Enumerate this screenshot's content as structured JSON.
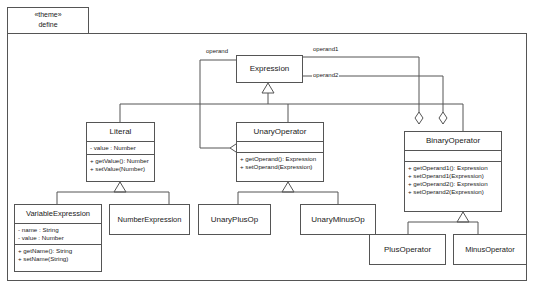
{
  "diagram": {
    "package": {
      "stereotype": "«theme»",
      "name": "define"
    },
    "colors": {
      "line": "#555555",
      "text": "#1a1a1a",
      "background": "#ffffff"
    },
    "classes": [
      {
        "id": "expression",
        "name": "Expression",
        "attributes": [],
        "operations": []
      },
      {
        "id": "literal",
        "name": "Literal",
        "attributes": [
          "- value : Number"
        ],
        "operations": [
          "+ getValue(): Number",
          "+ setValue(Number)"
        ]
      },
      {
        "id": "unaryoperator",
        "name": "UnaryOperator",
        "attributes": [],
        "operations": [
          "+ getOperand(): Expression",
          "+ setOperand(Expression)"
        ]
      },
      {
        "id": "binaryoperator",
        "name": "BinaryOperator",
        "attributes": [],
        "operations": [
          "+ getOperand1(): Expression",
          "+ setOperand1(Expression)",
          "+ getOperand2(): Expression",
          "+ setOperand2(Expression)"
        ]
      },
      {
        "id": "variableexpression",
        "name": "VariableExpression",
        "attributes": [
          "- name : String",
          "- value : Number"
        ],
        "operations": [
          "+ getName(): String",
          "+ setName(String)"
        ]
      },
      {
        "id": "numberexpression",
        "name": "NumberExpression",
        "attributes": [],
        "operations": []
      },
      {
        "id": "unaryplusop",
        "name": "UnaryPlusOp",
        "attributes": [],
        "operations": []
      },
      {
        "id": "unaryminusop",
        "name": "UnaryMinusOp",
        "attributes": [],
        "operations": []
      },
      {
        "id": "plusoperator",
        "name": "PlusOperator",
        "attributes": [],
        "operations": []
      },
      {
        "id": "minusoperator",
        "name": "MinusOperator",
        "attributes": [],
        "operations": []
      }
    ],
    "association_labels": {
      "operand": "operand",
      "operand1": "operand1",
      "operand2": "operand2"
    },
    "relationships": [
      {
        "type": "generalization",
        "from": "Literal",
        "to": "Expression"
      },
      {
        "type": "generalization",
        "from": "UnaryOperator",
        "to": "Expression"
      },
      {
        "type": "generalization",
        "from": "BinaryOperator",
        "to": "Expression"
      },
      {
        "type": "generalization",
        "from": "VariableExpression",
        "to": "Literal"
      },
      {
        "type": "generalization",
        "from": "NumberExpression",
        "to": "Literal"
      },
      {
        "type": "generalization",
        "from": "UnaryPlusOp",
        "to": "UnaryOperator"
      },
      {
        "type": "generalization",
        "from": "UnaryMinusOp",
        "to": "UnaryOperator"
      },
      {
        "type": "generalization",
        "from": "PlusOperator",
        "to": "BinaryOperator"
      },
      {
        "type": "generalization",
        "from": "MinusOperator",
        "to": "BinaryOperator"
      },
      {
        "type": "aggregation",
        "from": "UnaryOperator",
        "to": "Expression",
        "label": "operand"
      },
      {
        "type": "aggregation",
        "from": "BinaryOperator",
        "to": "Expression",
        "label": "operand1"
      },
      {
        "type": "aggregation",
        "from": "BinaryOperator",
        "to": "Expression",
        "label": "operand2"
      }
    ]
  }
}
